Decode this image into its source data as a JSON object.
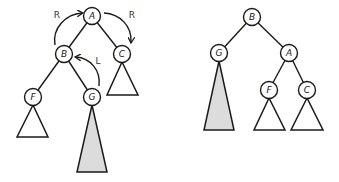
{
  "diagram": {
    "type": "tree-rotation",
    "colors": {
      "stroke": "#1a1a1a",
      "node_fill": "#ffffff",
      "highlighted_subtree_fill": "#dcdcdc",
      "plain_subtree_fill": "#ffffff"
    },
    "before": {
      "nodes": [
        {
          "id": "A",
          "label": "A",
          "x": 92,
          "y": 16
        },
        {
          "id": "B",
          "label": "B",
          "x": 64,
          "y": 54
        },
        {
          "id": "C",
          "label": "C",
          "x": 122,
          "y": 54
        },
        {
          "id": "F",
          "label": "F",
          "x": 33,
          "y": 97
        },
        {
          "id": "G",
          "label": "G",
          "x": 92,
          "y": 97
        }
      ],
      "edges": [
        [
          "A",
          "B"
        ],
        [
          "A",
          "C"
        ],
        [
          "B",
          "F"
        ],
        [
          "B",
          "G"
        ]
      ],
      "subtrees": [
        {
          "under": "C",
          "highlighted": false
        },
        {
          "under": "F",
          "highlighted": false
        },
        {
          "under": "G",
          "highlighted": true
        }
      ],
      "rotation_arrows": [
        {
          "label": "R",
          "from": "B",
          "to": "A"
        },
        {
          "label": "R",
          "from": "A",
          "to": "C"
        },
        {
          "label": "L",
          "from": "G",
          "to": "B"
        }
      ]
    },
    "after": {
      "nodes": [
        {
          "id": "B",
          "label": "B",
          "x": 252,
          "y": 17
        },
        {
          "id": "G",
          "label": "G",
          "x": 219,
          "y": 53
        },
        {
          "id": "A",
          "label": "A",
          "x": 289,
          "y": 53
        },
        {
          "id": "F",
          "label": "F",
          "x": 269,
          "y": 90
        },
        {
          "id": "C",
          "label": "C",
          "x": 307,
          "y": 90
        }
      ],
      "edges": [
        [
          "B",
          "G"
        ],
        [
          "B",
          "A"
        ],
        [
          "A",
          "F"
        ],
        [
          "A",
          "C"
        ]
      ],
      "subtrees": [
        {
          "under": "G",
          "highlighted": true
        },
        {
          "under": "F",
          "highlighted": false
        },
        {
          "under": "C",
          "highlighted": false
        }
      ]
    },
    "labels": {
      "left_A": "A",
      "left_B": "B",
      "left_C": "C",
      "left_F": "F",
      "left_G": "G",
      "right_A": "A",
      "right_B": "B",
      "right_C": "C",
      "right_F": "F",
      "right_G": "G",
      "arrow_r_left": "R",
      "arrow_r_right": "R",
      "arrow_l": "L"
    }
  }
}
